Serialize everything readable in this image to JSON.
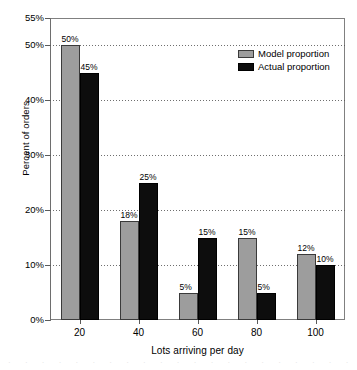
{
  "chart_data": {
    "type": "bar",
    "title": "",
    "xlabel": "Lots arriving per day",
    "ylabel": "Percent of orders",
    "categories": [
      "20",
      "40",
      "60",
      "80",
      "100"
    ],
    "series": [
      {
        "name": "Model proportion",
        "color": "#9d9d9d",
        "values": [
          50,
          18,
          5,
          15,
          12
        ],
        "labels": [
          "50%",
          "18%",
          "5%",
          "15%",
          "12%"
        ]
      },
      {
        "name": "Actual proportion",
        "color": "#0d0d0d",
        "values": [
          45,
          25,
          15,
          5,
          10
        ],
        "labels": [
          "45%",
          "25%",
          "15%",
          "5%",
          "10%"
        ]
      }
    ],
    "ylim": [
      0,
      55
    ],
    "yticks": [
      0,
      10,
      20,
      30,
      40,
      50,
      55
    ],
    "ytick_labels": [
      "0%",
      "10%",
      "20%",
      "30%",
      "40%",
      "50%",
      "55%"
    ],
    "gridlines": [
      10,
      20,
      30,
      40,
      50
    ],
    "grid": true,
    "legend_position": "top-right"
  },
  "legend": {
    "items": [
      {
        "label": "Model proportion"
      },
      {
        "label": "Actual proportion"
      }
    ]
  },
  "axes": {
    "y_title": "Percent of orders",
    "x_title": "Lots arriving per day"
  },
  "artifact": {
    "text": "· · · · · · · · · · · · · · · · · · · · · · · · · · ·"
  }
}
